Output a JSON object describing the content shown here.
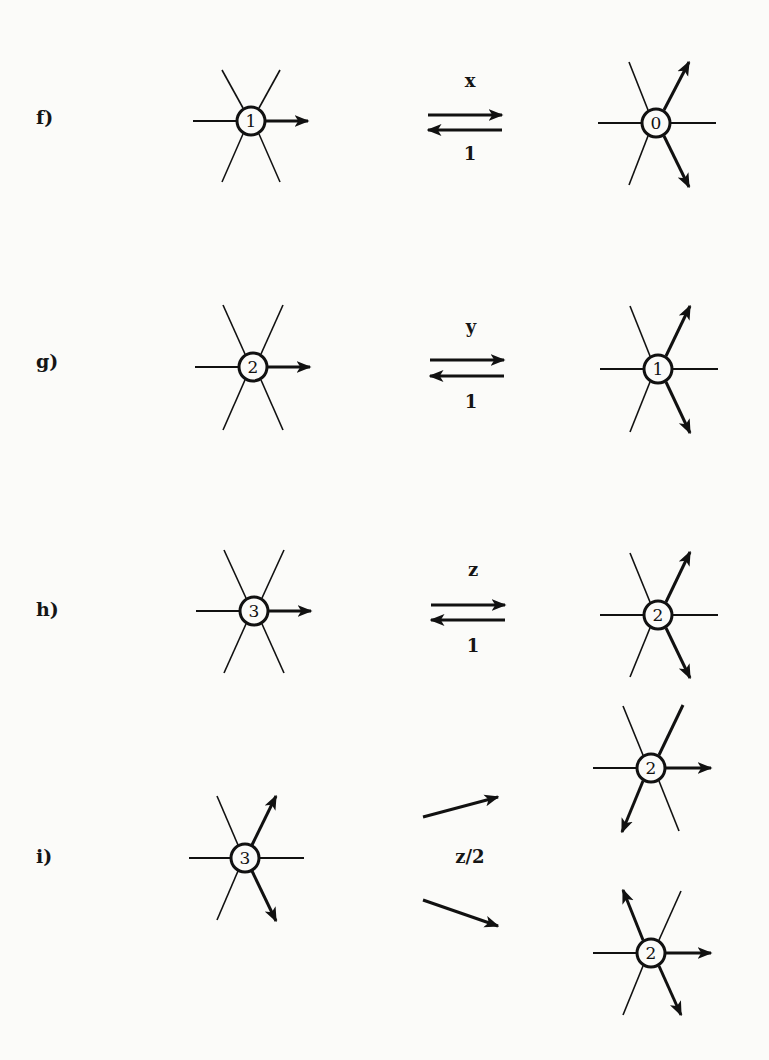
{
  "figure": {
    "rows": [
      {
        "label": "f)",
        "reaction_type": "reversible",
        "forward_rate": "x",
        "backward_rate": "1",
        "left_node": {
          "value": "1",
          "outgoing_arrows": [
            "right"
          ]
        },
        "right_nodes": [
          {
            "value": "0",
            "outgoing_arrows": [
              "up-right",
              "down-right"
            ]
          }
        ]
      },
      {
        "label": "g)",
        "reaction_type": "reversible",
        "forward_rate": "y",
        "backward_rate": "1",
        "left_node": {
          "value": "2",
          "outgoing_arrows": [
            "right"
          ]
        },
        "right_nodes": [
          {
            "value": "1",
            "outgoing_arrows": [
              "up-right",
              "down-right"
            ]
          }
        ]
      },
      {
        "label": "h)",
        "reaction_type": "reversible",
        "forward_rate": "z",
        "backward_rate": "1",
        "left_node": {
          "value": "3",
          "outgoing_arrows": [
            "right"
          ]
        },
        "right_nodes": [
          {
            "value": "2",
            "outgoing_arrows": [
              "up-right",
              "down-right"
            ]
          }
        ]
      },
      {
        "label": "i)",
        "reaction_type": "branching",
        "rate": "z/2",
        "left_node": {
          "value": "3",
          "outgoing_arrows": [
            "up-right",
            "down-right"
          ]
        },
        "right_nodes": [
          {
            "value": "2",
            "outgoing_arrows": [
              "right",
              "down-left"
            ]
          },
          {
            "value": "2",
            "outgoing_arrows": [
              "up-left",
              "right",
              "down-right"
            ]
          }
        ]
      }
    ],
    "colors": {
      "ink": "#111111",
      "paper": "#fbfbf9"
    }
  }
}
